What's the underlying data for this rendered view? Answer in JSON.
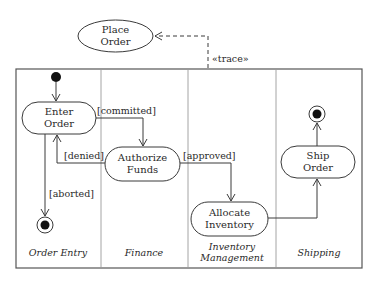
{
  "use_case": {
    "label_lines": [
      "Place",
      "Order"
    ],
    "trace_label": "«trace»"
  },
  "swimlanes": [
    {
      "label_lines": [
        "Order Entry"
      ]
    },
    {
      "label_lines": [
        "Finance"
      ]
    },
    {
      "label_lines": [
        "Inventory",
        "Management"
      ]
    },
    {
      "label_lines": [
        "Shipping"
      ]
    }
  ],
  "actions": {
    "enter_order": {
      "label_lines": [
        "Enter",
        "Order"
      ]
    },
    "authorize_funds": {
      "label_lines": [
        "Authorize",
        "Funds"
      ]
    },
    "allocate_inventory": {
      "label_lines": [
        "Allocate",
        "Inventory"
      ]
    },
    "ship_order": {
      "label_lines": [
        "Ship",
        "Order"
      ]
    }
  },
  "guards": {
    "committed": "[committed]",
    "denied": "[denied]",
    "aborted": "[aborted]",
    "approved": "[approved]"
  },
  "colors": {
    "line": "#3a3a3a",
    "lane_divider": "#9a9a9a",
    "node_fill": "#ffffff",
    "token": "#111111"
  }
}
